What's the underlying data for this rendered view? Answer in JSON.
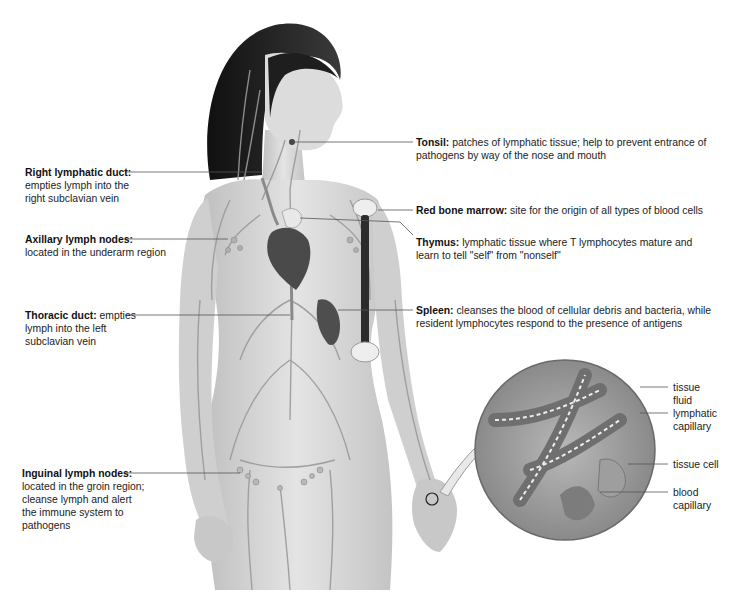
{
  "figure": {
    "colors": {
      "background": "#ffffff",
      "skin": "#d6d6d6",
      "vessels": "#a9a9a9",
      "hair": "#1e1e1e",
      "heart": "#4a4a4a",
      "leader_line": "#555555",
      "text": "#222222"
    }
  },
  "labels_left": [
    {
      "title": "Right lymphatic duct:",
      "desc": "",
      "lines": [
        "empties lymph into the",
        "right subclavian vein"
      ]
    },
    {
      "title": "Axillary lymph nodes:",
      "desc": "",
      "lines": [
        "located in the underarm region"
      ]
    },
    {
      "title": "Thoracic duct:",
      "desc": " empties",
      "lines": [
        "lymph into the left",
        "subclavian vein"
      ]
    },
    {
      "title": "Inguinal lymph nodes:",
      "desc": "",
      "lines": [
        "located in the groin region;",
        "cleanse lymph and alert",
        "the immune system to",
        "pathogens"
      ]
    }
  ],
  "labels_right": [
    {
      "title": "Tonsil:",
      "desc": " patches of lymphatic tissue; help to prevent entrance of",
      "lines": [
        "pathogens by way of the nose and mouth"
      ]
    },
    {
      "title": "Red bone marrow:",
      "desc": " site for the origin of all types of blood cells",
      "lines": []
    },
    {
      "title": "Thymus:",
      "desc": " lymphatic tissue where T lymphocytes mature and",
      "lines": [
        "learn to tell \"self\" from \"nonself\""
      ]
    },
    {
      "title": "Spleen:",
      "desc": " cleanses the blood of cellular debris and bacteria, while",
      "lines": [
        "resident lymphocytes respond to the presence of antigens"
      ]
    }
  ],
  "inset": {
    "description": "Magnified view of tissue at the hand",
    "labels": [
      {
        "lines": [
          "tissue",
          "fluid"
        ]
      },
      {
        "lines": [
          "lymphatic",
          "capillary"
        ]
      },
      {
        "lines": [
          "tissue cell"
        ]
      },
      {
        "lines": [
          "blood",
          "capillary"
        ]
      }
    ]
  }
}
